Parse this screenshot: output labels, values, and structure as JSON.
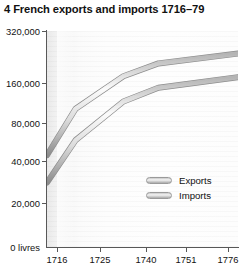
{
  "figure": {
    "title": "4 French exports and imports 1716–79",
    "number": "4"
  },
  "legend": {
    "position": "inside-lower-right",
    "entries": [
      {
        "label": "Exports",
        "swatch": "gray-bevel-bar"
      },
      {
        "label": "Imports",
        "swatch": "gray-bevel-bar"
      }
    ]
  },
  "axis": {
    "y_origin_label": "0 livres",
    "y_tick_labels": [
      "320,000",
      "160,000",
      "80,000",
      "40,000",
      "20,000",
      "0 livres"
    ],
    "x_tick_labels": [
      "1716",
      "1725",
      "1740",
      "1751",
      "1776"
    ]
  },
  "colors": {
    "line_light": "#f2f2f2",
    "line_mid": "#cfcfcf",
    "line_dark": "#8f8f8f",
    "axis": "#585858",
    "text": "#111111",
    "panel": "#fdfdfd",
    "page_background": "#ffffff"
  },
  "chart_data": {
    "type": "line",
    "title": "4 French exports and imports 1716–79",
    "xlabel": "",
    "ylabel": "",
    "yscale": "log",
    "ylim": [
      10000,
      400000
    ],
    "y_ticks": [
      20000,
      40000,
      80000,
      160000,
      320000
    ],
    "y_tick_labels": [
      "20,000",
      "40,000",
      "80,000",
      "160,000",
      "320,000"
    ],
    "y_zero_label": "0 livres",
    "grid": "horizontal-faint",
    "legend_position": "lower right",
    "x": [
      1716,
      1725,
      1740,
      1751,
      1776
    ],
    "x_tick_labels": [
      "1716",
      "1725",
      "1740",
      "1751",
      "1776"
    ],
    "units": "livres",
    "series": [
      {
        "name": "Exports",
        "values": [
          48000,
          106000,
          185000,
          230000,
          272000
        ]
      },
      {
        "name": "Imports",
        "values": [
          30000,
          62000,
          120000,
          152000,
          182000
        ]
      }
    ]
  }
}
